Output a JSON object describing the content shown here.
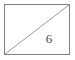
{
  "figure": {
    "kind": "rectangle-with-diagonal",
    "canvas": {
      "width": 75,
      "height": 60,
      "background_color": "#ffffff"
    },
    "rectangle": {
      "name": "rectangle-outline",
      "x": 4.5,
      "y": 4.5,
      "width": 65,
      "height": 50,
      "stroke_color": "#808080",
      "stroke_width": 1,
      "fill": "none"
    },
    "diagonal": {
      "name": "diagonal-line",
      "x1": 4.5,
      "y1": 54.5,
      "x2": 69.5,
      "y2": 4.5,
      "stroke_color": "#9a9a9a",
      "stroke_width": 1,
      "from_corner": "bottom-left",
      "to_corner": "top-right"
    },
    "labels": [
      {
        "name": "diagonal-length-label",
        "text": "6",
        "x": 49,
        "y": 39,
        "color": "#4a4a4a",
        "font_size": 13,
        "region": "lower-right-triangle"
      }
    ]
  }
}
